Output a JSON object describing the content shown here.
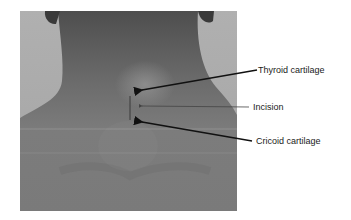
{
  "figure": {
    "labels": [
      {
        "id": "thyroid",
        "text": "Thyroid cartilage"
      },
      {
        "id": "incision",
        "text": "Incision"
      },
      {
        "id": "cricoid",
        "text": "Cricoid cartilage"
      }
    ],
    "colors": {
      "background": "#ffffff",
      "photo_bg": "#a9a9a9",
      "skin": "#7a7a7a",
      "arrow": "#111111"
    }
  }
}
